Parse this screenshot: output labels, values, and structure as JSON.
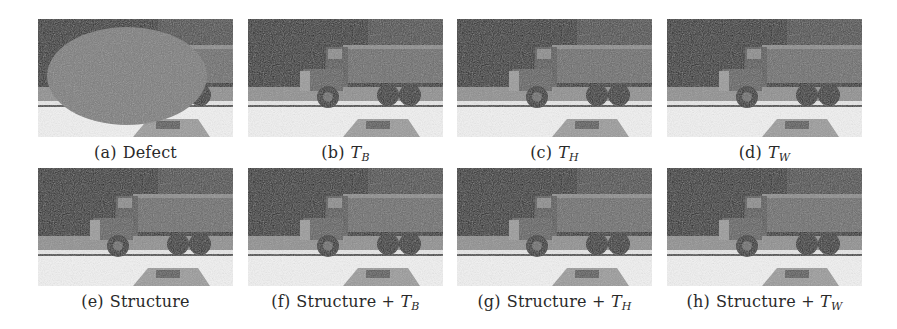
{
  "figure": {
    "panels": [
      {
        "label": "(a)",
        "text": "Defect",
        "math": "",
        "sub": "",
        "content": "defect-mask"
      },
      {
        "label": "(b)",
        "text": "",
        "math": "T",
        "sub": "B",
        "content": "truck-restored"
      },
      {
        "label": "(c)",
        "text": "",
        "math": "T",
        "sub": "H",
        "content": "truck-restored"
      },
      {
        "label": "(d)",
        "text": "",
        "math": "T",
        "sub": "W",
        "content": "truck-restored"
      },
      {
        "label": "(e)",
        "text": "Structure",
        "math": "",
        "sub": "",
        "content": "truck-restored"
      },
      {
        "label": "(f)",
        "text": "Structure + ",
        "math": "T",
        "sub": "B",
        "content": "truck-restored"
      },
      {
        "label": "(g)",
        "text": "Structure + ",
        "math": "T",
        "sub": "H",
        "content": "truck-restored"
      },
      {
        "label": "(h)",
        "text": "Structure + ",
        "math": "T",
        "sub": "W",
        "content": "truck-restored"
      }
    ],
    "colors": {
      "background": "#ffffff",
      "trees": "#2e2e2e",
      "truck": "#5a5a5a",
      "road": "#d8d8d8",
      "defect": "#7c7c7c",
      "caption": "#2a2a2a"
    }
  }
}
